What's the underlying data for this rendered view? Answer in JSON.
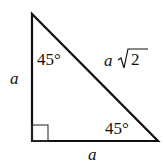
{
  "diagram": {
    "labels": {
      "left_side": "a",
      "bottom_side": "a",
      "hypotenuse_var": "a",
      "hypotenuse_radical": "2",
      "top_angle": "45°",
      "bottom_right_angle": "45°"
    },
    "colors": {
      "stroke": "#111111",
      "background": "#ffffff"
    }
  }
}
